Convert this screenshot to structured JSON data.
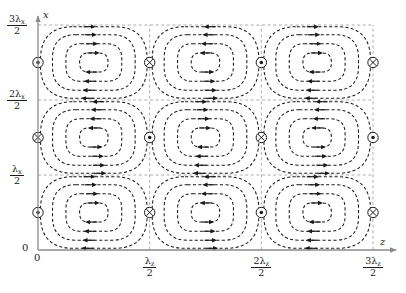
{
  "figure": {
    "background": "#ffffff",
    "ink": "#1a1a1a",
    "grid_color": "#9a9a9a",
    "axis_color": "#8a8a8a"
  },
  "axes": {
    "x_axis": {
      "name": "x",
      "label": "x",
      "orientation": "vertical",
      "arrow": true,
      "tick_labels": [
        {
          "value": 0,
          "num": "0",
          "den": "",
          "plain": "0"
        },
        {
          "value": 1,
          "num": "λ",
          "sub": "x",
          "den": "2"
        },
        {
          "value": 2,
          "num": "2λ",
          "sub": "x",
          "den": "2"
        },
        {
          "value": 3,
          "num": "3λ",
          "sub": "x",
          "den": "2"
        }
      ]
    },
    "z_axis": {
      "name": "z",
      "label": "z",
      "orientation": "horizontal",
      "arrow": true,
      "tick_labels": [
        {
          "value": 0,
          "num": "0",
          "den": "",
          "plain": "0"
        },
        {
          "value": 1,
          "num": "λ",
          "sub": "z",
          "den": "2"
        },
        {
          "value": 2,
          "num": "2λ",
          "sub": "z",
          "den": "2"
        },
        {
          "value": 3,
          "num": "3λ",
          "sub": "z",
          "den": "2"
        }
      ]
    }
  },
  "chart_data": {
    "type": "line",
    "title": "",
    "xlabel": "z",
    "ylabel": "x",
    "xlim": [
      0,
      3
    ],
    "ylim": [
      0,
      3
    ],
    "grid": true,
    "legend": "none",
    "cell_columns": 3,
    "cell_rows": 3,
    "cell_width_units": 1,
    "cell_height_units": 1,
    "contours_per_cell": 4,
    "cells": [
      {
        "row": 0,
        "col": 0,
        "center_z": 0.5,
        "center_x": 2.5,
        "rotation": "clockwise"
      },
      {
        "row": 0,
        "col": 1,
        "center_z": 1.5,
        "center_x": 2.5,
        "rotation": "counterclockwise"
      },
      {
        "row": 0,
        "col": 2,
        "center_z": 2.5,
        "center_x": 2.5,
        "rotation": "clockwise"
      },
      {
        "row": 1,
        "col": 0,
        "center_z": 0.5,
        "center_x": 1.5,
        "rotation": "counterclockwise"
      },
      {
        "row": 1,
        "col": 1,
        "center_z": 1.5,
        "center_x": 1.5,
        "rotation": "clockwise"
      },
      {
        "row": 1,
        "col": 2,
        "center_z": 2.5,
        "center_x": 1.5,
        "rotation": "counterclockwise"
      },
      {
        "row": 2,
        "col": 0,
        "center_z": 0.5,
        "center_x": 0.5,
        "rotation": "clockwise"
      },
      {
        "row": 2,
        "col": 1,
        "center_z": 1.5,
        "center_x": 0.5,
        "rotation": "counterclockwise"
      },
      {
        "row": 2,
        "col": 2,
        "center_z": 2.5,
        "center_x": 0.5,
        "rotation": "clockwise"
      }
    ],
    "vorticity_markers": [
      {
        "z": 0,
        "x": 2.5,
        "symbol": "circle-dot",
        "meaning": "out-of-page"
      },
      {
        "z": 1,
        "x": 2.5,
        "symbol": "circle-cross",
        "meaning": "into-page"
      },
      {
        "z": 2,
        "x": 2.5,
        "symbol": "circle-dot",
        "meaning": "out-of-page"
      },
      {
        "z": 3,
        "x": 2.5,
        "symbol": "circle-cross",
        "meaning": "into-page"
      },
      {
        "z": 0,
        "x": 1.5,
        "symbol": "circle-cross",
        "meaning": "into-page"
      },
      {
        "z": 1,
        "x": 1.5,
        "symbol": "circle-dot",
        "meaning": "out-of-page"
      },
      {
        "z": 2,
        "x": 1.5,
        "symbol": "circle-cross",
        "meaning": "into-page"
      },
      {
        "z": 3,
        "x": 1.5,
        "symbol": "circle-dot",
        "meaning": "out-of-page"
      },
      {
        "z": 0,
        "x": 0.5,
        "symbol": "circle-dot",
        "meaning": "out-of-page"
      },
      {
        "z": 1,
        "x": 0.5,
        "symbol": "circle-cross",
        "meaning": "into-page"
      },
      {
        "z": 2,
        "x": 0.5,
        "symbol": "circle-dot",
        "meaning": "out-of-page"
      },
      {
        "z": 3,
        "x": 0.5,
        "symbol": "circle-cross",
        "meaning": "into-page"
      }
    ],
    "gridlines_z": [
      1,
      2,
      3
    ],
    "gridlines_x": [
      1,
      2,
      3
    ]
  }
}
